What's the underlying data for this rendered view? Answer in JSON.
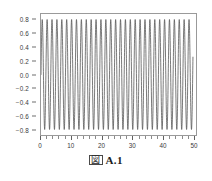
{
  "figure": {
    "caption_symbol": "図",
    "caption_text": "A.1",
    "caption_full": "図 A.1"
  },
  "style": {
    "background": "#ffffff",
    "line_color": "#4a4a4a",
    "border_color": "#9a9a9a",
    "tick_color": "#6f6f6f",
    "label_color": "#3a3a3a"
  },
  "chart_data": {
    "type": "line",
    "title": "",
    "subtitle": "",
    "xlabel": "",
    "ylabel": "",
    "xlim": [
      0,
      51
    ],
    "ylim": [
      -0.88,
      0.88
    ],
    "grid": false,
    "legend": null,
    "legend_position": "none",
    "xticks": [
      0,
      10,
      20,
      30,
      40,
      50
    ],
    "xtick_labels": [
      "0",
      "10",
      "20",
      "30",
      "40",
      "50"
    ],
    "xtick_minor_step": 2,
    "yticks": [
      0.8,
      0.6,
      0.4,
      0.2,
      0.0,
      -0.2,
      -0.4,
      -0.6,
      -0.8
    ],
    "ytick_labels": [
      "0.8",
      "0.6",
      "0.4",
      "0.2",
      "0.0",
      "-0.2",
      "-0.4",
      "-0.6",
      "-0.8"
    ],
    "series": [
      {
        "name": "oscillation",
        "description": "dense sinusoidal oscillation",
        "amplitude": 0.8,
        "period": 1.61,
        "frequency": 0.621,
        "angular_frequency": 3.902,
        "phase": 0.0,
        "cycles_visible": 31,
        "x_start": 0,
        "x_end": 50,
        "y_start": 0.0,
        "y_end": 0.0,
        "y_max": 0.8,
        "y_min": -0.8,
        "samples": 2400
      }
    ],
    "annotations": []
  }
}
